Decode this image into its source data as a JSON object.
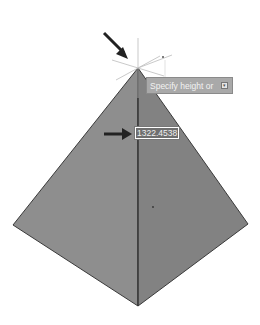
{
  "viewport": {
    "model": "pyramid",
    "colors": {
      "left_face": "#8c8c8c",
      "right_face": "#808080",
      "edge": "#3a3a3a",
      "background": "#ffffff",
      "arrow": "#222222"
    }
  },
  "tooltip": {
    "prompt": "Specify height or",
    "options_icon": "down-arrow-icon"
  },
  "dynamic_input": {
    "value": "1322.4538"
  }
}
